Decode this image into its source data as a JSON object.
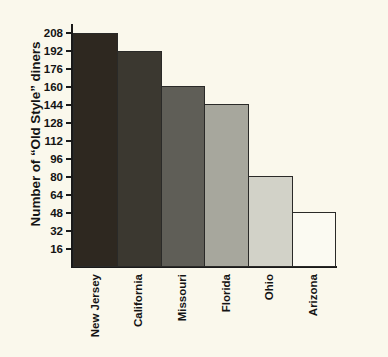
{
  "chart_data": {
    "type": "bar",
    "title": "",
    "xlabel": "",
    "ylabel": "Number of “Old Style” diners",
    "categories": [
      "New Jersey",
      "California",
      "Missouri",
      "Florida",
      "Ohio",
      "Arizona"
    ],
    "values": [
      208,
      192,
      161,
      145,
      81,
      49
    ],
    "bar_colors": [
      "#2e2820",
      "#3b3830",
      "#5f5e57",
      "#a7a79d",
      "#d2d2c8",
      "#fbfaf2"
    ],
    "ylim": [
      0,
      216
    ],
    "yticks": [
      16,
      32,
      48,
      64,
      80,
      96,
      112,
      128,
      144,
      160,
      176,
      192,
      208
    ],
    "ytick_labels": [
      "16",
      "32",
      "48",
      "64",
      "80",
      "96",
      "112",
      "128",
      "144",
      "160",
      "176",
      "192",
      "208"
    ],
    "grid": false,
    "legend": null,
    "background_color": "#faf8ec",
    "axis_color": "#1a1a1a"
  }
}
